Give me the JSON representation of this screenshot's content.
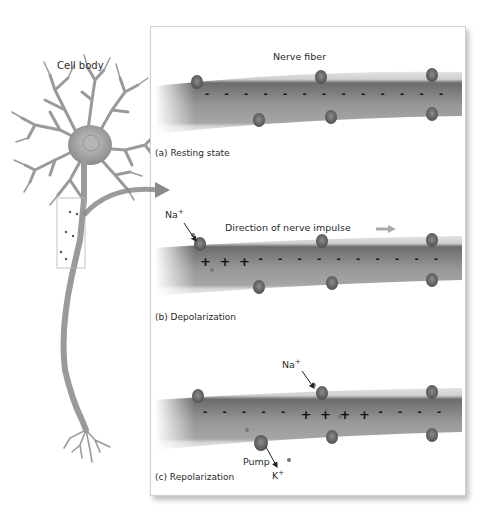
{
  "figure": {
    "neuron_label": "Cell body",
    "panels": [
      {
        "id": "a",
        "caption": "(a) Resting state",
        "title": "Nerve fiber",
        "interior_charges": [
          "-",
          "-",
          "-",
          "-",
          "-",
          "-",
          "-",
          "-",
          "-",
          "-",
          "-",
          "-",
          "-"
        ]
      },
      {
        "id": "b",
        "caption": "(b) Depolarization",
        "title": "Direction of nerve impulse",
        "ion_label": "Na",
        "ion_sup": "+",
        "interior_charges": [
          "+",
          "+",
          "+",
          "-",
          "-",
          "-",
          "-",
          "-",
          "-",
          "-",
          "-",
          "-",
          "-"
        ]
      },
      {
        "id": "c",
        "caption": "(c) Repolarization",
        "ion_label_top": "Na",
        "ion_label_top_sup": "+",
        "pump_label": "Pump",
        "ion_label_bottom": "K",
        "ion_label_bottom_sup": "+",
        "interior_charges": [
          "-",
          "-",
          "-",
          "-",
          "-",
          "+",
          "+",
          "+",
          "+",
          "-",
          "-",
          "-",
          "-"
        ]
      }
    ],
    "colors": {
      "axon_interior": "#8e8e8e",
      "membrane": "#d9d9d9",
      "channel": "#6e6e6e",
      "arrow": "#8a8a8a",
      "neuron": "#9a9a9a"
    }
  }
}
